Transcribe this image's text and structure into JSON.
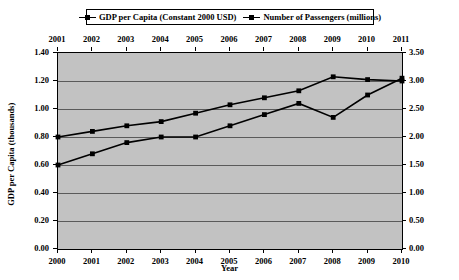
{
  "chart_data": {
    "type": "line",
    "title": "",
    "xlabel": "Year",
    "categories": [
      "2000",
      "2001",
      "2002",
      "2003",
      "2004",
      "2005",
      "2006",
      "2007",
      "2008",
      "2009",
      "2010"
    ],
    "top_axis_labels": [
      "2001",
      "2002",
      "2003",
      "2004",
      "2005",
      "2006",
      "2007",
      "2008",
      "2009",
      "2010",
      "2011"
    ],
    "grid": true,
    "legend_position": "top",
    "axes": {
      "left": {
        "label": "GDP per Capita (thousands)",
        "ticks": [
          "0.00",
          "0.20",
          "0.40",
          "0.60",
          "0.80",
          "1.00",
          "1.20",
          "1.40"
        ],
        "min": 0.0,
        "max": 1.4
      },
      "right": {
        "label": "Number of Passengers (millions)",
        "ticks": [
          "0.00",
          "0.50",
          "1.00",
          "1.50",
          "2.00",
          "2.50",
          "3.00",
          "3.50"
        ],
        "min": 0.0,
        "max": 3.5
      }
    },
    "series": [
      {
        "name": "GDP per Capita (Constant 2000 USD)",
        "axis": "left",
        "marker": "square",
        "color": "#000000",
        "values": [
          0.8,
          0.84,
          0.88,
          0.91,
          0.97,
          1.03,
          1.08,
          1.13,
          1.23,
          1.21,
          1.2
        ]
      },
      {
        "name": "Number of Passengers (millions)",
        "axis": "right",
        "marker": "square",
        "color": "#000000",
        "values": [
          1.5,
          1.7,
          1.9,
          2.0,
          2.0,
          2.2,
          2.4,
          2.6,
          2.35,
          2.75,
          3.05
        ]
      }
    ]
  }
}
